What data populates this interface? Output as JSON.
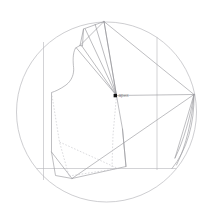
{
  "figure": {
    "kind": "technical-line-drawing",
    "background_color": "#ffffff"
  },
  "colors": {
    "circle_stroke": "#b9b9bd",
    "pattern_stroke": "#9a9a9f",
    "guide_stroke": "#b5b5ba",
    "ray_stroke": "#8e8e94",
    "dashed_stroke": "#c2c2c7",
    "marker_fill": "#111111",
    "label_text": "#8a8a8a"
  },
  "circle": {
    "cx": 106.5,
    "cy": 112,
    "r": 90,
    "stroke_width": 0.7
  },
  "pivot": {
    "label": "apex",
    "x": 116.5,
    "y": 95.5,
    "marker_x": 113.6,
    "marker_y": 95.6,
    "marker_size": 3.4
  },
  "guides": {
    "vertical": [
      {
        "name": "left-grainline",
        "x": 43.5,
        "y1": 42.0,
        "y2": 180.0
      },
      {
        "name": "right-grainline",
        "x": 157.0,
        "y1": 37.0,
        "y2": 170.0
      }
    ],
    "horizontal": [
      {
        "name": "hem-baseline",
        "y": 168.5,
        "x1": 37.0,
        "x2": 176.0
      }
    ]
  },
  "paths": {
    "bodice_outline": "M 104.0 21.5 L 83.5 29.0 L 80.0 45.5 L 75.5 48.0 C 72.5 53.5 73.0 62.0 73.6 67.5 C 74.2 73.5 72.0 80.5 66.0 85.0 C 60.5 89.0 55.0 91.5 51.5 92.5 L 51.5 152.0 L 55.5 175.5 L 72.0 178.5",
    "neckline_edge": "M 83.5 29.0 L 82.5 46.0 L 80.0 45.5",
    "shoulder_seam": "M 104.0 21.5 L 80.0 45.5",
    "side_seam_right": "M 116.5 95.5 L 122.5 129.0 L 126.0 166.5",
    "front_center_fold": "M 104.0 21.5 L 116.5 95.5",
    "lower_body_panel": "M 51.5 152.0 L 72.0 178.5 L 126.0 166.5 L 122.5 129.0",
    "diagonal_major": "M 72.0 178.5 L 194.0 94.5",
    "lower_wedge": "M 116.5 95.5 L 194.0 94.5",
    "upper_wedge": "M 104.0 21.5 L 194.0 94.5",
    "right_arc_outer": "M 194.0 94.5 C 194.5 124.0 187.0 150.0 172.0 168.5",
    "right_arc_inner": "M 194.0 94.5 C 192.0 120.0 186.5 145.0 176.5 165.0",
    "right_arc_inner2": "M 194.0 94.5 C 190.0 118.0 184.0 140.0 175.0 158.0",
    "right_closing": "M 194.0 94.5 L 175.0 158.0"
  },
  "dart_rays": [
    {
      "name": "ray-shoulder-1",
      "x1": 116.5,
      "y1": 95.5,
      "x2": 85.0,
      "y2": 28.5
    },
    {
      "name": "ray-shoulder-2",
      "x1": 116.5,
      "y1": 95.5,
      "x2": 95.0,
      "y2": 24.0
    },
    {
      "name": "ray-shoulder-3",
      "x1": 116.5,
      "y1": 95.5,
      "x2": 104.0,
      "y2": 21.5
    },
    {
      "name": "ray-armhole-1",
      "x1": 116.5,
      "y1": 95.5,
      "x2": 76.0,
      "y2": 47.5
    },
    {
      "name": "ray-neck-1",
      "x1": 116.5,
      "y1": 95.5,
      "x2": 81.5,
      "y2": 45.5
    }
  ],
  "dashed_paths": {
    "dart_leg_shadow": "M 51.5 92.5 L 59.5 142.0 L 69.0 176.0",
    "dart_underlay": "M 59.5 142.0 L 118.0 168.5",
    "center_drop": "M 116.5 95.5 L 113.0 135.0 L 112.0 167.0",
    "hem_shadow": "M 69.0 176.0 L 118.0 168.5"
  },
  "annotations": {
    "pivot_point_name": "apex",
    "marker_shape": "square"
  }
}
